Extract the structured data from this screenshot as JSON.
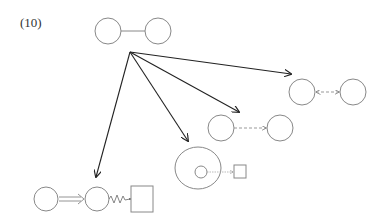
{
  "figure": {
    "label": "(10)"
  },
  "colors": {
    "shape_stroke": "#888888",
    "arrow_stroke": "#222222",
    "dashed_stroke": "#999999",
    "background": "#ffffff"
  },
  "nodes": {
    "top_pair": {
      "description": "two circles connected by a solid line",
      "left_circle": {
        "cx": 108,
        "cy": 31,
        "r": 13
      },
      "right_circle": {
        "cx": 158,
        "cy": 31,
        "r": 13
      },
      "connector": "solid-line"
    },
    "right_pair": {
      "description": "two circles with dashed bidirectional arrow",
      "left_circle": {
        "cx": 302,
        "cy": 92,
        "r": 13
      },
      "right_circle": {
        "cx": 353,
        "cy": 92,
        "r": 13
      },
      "connector": "dashed-bidirectional-arrow"
    },
    "middle_pair": {
      "description": "two circles with dashed one-way arrow",
      "left_circle": {
        "cx": 221,
        "cy": 128,
        "r": 13
      },
      "right_circle": {
        "cx": 280,
        "cy": 128,
        "r": 13
      },
      "connector": "dashed-arrow"
    },
    "nested_group": {
      "description": "large circle containing small circle, dotted arrow to small square",
      "outer_circle": {
        "cx": 198,
        "cy": 168,
        "r": 22
      },
      "inner_circle": {
        "cx": 201,
        "cy": 172,
        "r": 6
      },
      "square": {
        "x": 234,
        "y": 165,
        "w": 12,
        "h": 12
      },
      "connector": "dotted-arrow"
    },
    "bottom_chain": {
      "description": "circle, double arrow, circle, wavy line, square",
      "circle_a": {
        "cx": 46,
        "cy": 199,
        "r": 12
      },
      "circle_b": {
        "cx": 97,
        "cy": 199,
        "r": 12
      },
      "square": {
        "x": 131,
        "y": 186,
        "w": 22,
        "h": 26
      },
      "connectors": [
        "double-arrow",
        "wavy-line"
      ]
    }
  },
  "arrows": {
    "origin": {
      "x": 130,
      "y": 52
    },
    "targets": [
      {
        "name": "to-right-pair",
        "x": 291,
        "y": 74
      },
      {
        "name": "to-middle-pair",
        "x": 239,
        "y": 112
      },
      {
        "name": "to-nested-group",
        "x": 188,
        "y": 141
      },
      {
        "name": "to-bottom-chain",
        "x": 96,
        "y": 177
      }
    ]
  }
}
